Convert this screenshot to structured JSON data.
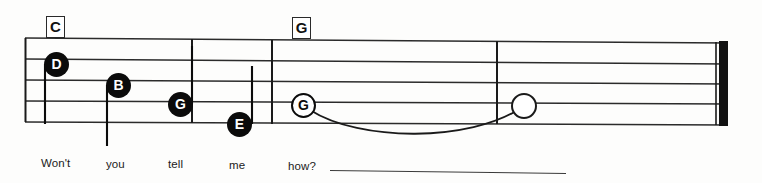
{
  "document": {
    "kind": "music-staff-notation",
    "title": "Won't you tell me how?"
  },
  "staff": {
    "line_count": 5,
    "ink_color": "#1a1a1a",
    "paper_color": "#fdfdfc"
  },
  "chords": [
    {
      "label": "C",
      "name": "chord-symbol-c",
      "x": 46,
      "y": 16
    },
    {
      "label": "G",
      "name": "chord-symbol-g",
      "x": 292,
      "y": 17
    }
  ],
  "notes": [
    {
      "letter": "D",
      "style": "filled",
      "x": 44,
      "y": 52,
      "stem": "down-left"
    },
    {
      "letter": "B",
      "style": "filled",
      "x": 106,
      "y": 73,
      "stem": "down-left"
    },
    {
      "letter": "G",
      "style": "filled",
      "x": 168,
      "y": 92,
      "stem": "up-right"
    },
    {
      "letter": "E",
      "style": "filled",
      "x": 227,
      "y": 112,
      "stem": "up-right"
    },
    {
      "letter": "G",
      "style": "open",
      "x": 291,
      "y": 93,
      "stem": "none"
    },
    {
      "letter": "",
      "style": "whole",
      "x": 511,
      "y": 93,
      "stem": "none"
    }
  ],
  "tie": {
    "name": "tie-slur",
    "from_x": 310,
    "to_x": 520,
    "label": "tie"
  },
  "barlines": [
    {
      "name": "barline-start",
      "x": 25
    },
    {
      "name": "barline-1",
      "x": 192
    },
    {
      "name": "barline-2",
      "x": 272
    },
    {
      "name": "barline-3",
      "x": 497
    },
    {
      "name": "barline-final",
      "x": 718
    }
  ],
  "lyrics": {
    "words": [
      {
        "text": "Won't",
        "x": 41,
        "y": 157
      },
      {
        "text": "you",
        "x": 106,
        "y": 158
      },
      {
        "text": "tell",
        "x": 168,
        "y": 158
      },
      {
        "text": "me",
        "x": 229,
        "y": 159
      },
      {
        "text": "how?",
        "x": 288,
        "y": 160
      }
    ],
    "extender": {
      "from_x": 330,
      "to_x": 566,
      "y": 170
    }
  }
}
